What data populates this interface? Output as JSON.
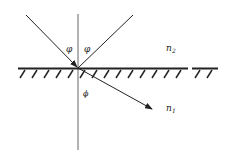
{
  "diagram": {
    "type": "refraction-at-interface",
    "labels": {
      "incident_angle": "φ",
      "reflected_angle": "φ",
      "refracted_angle": "ϕ",
      "medium_upper": "n",
      "medium_upper_sub": "2",
      "medium_lower": "n",
      "medium_lower_sub": "1"
    },
    "colors": {
      "line": "#222222",
      "background": "#ffffff"
    }
  }
}
